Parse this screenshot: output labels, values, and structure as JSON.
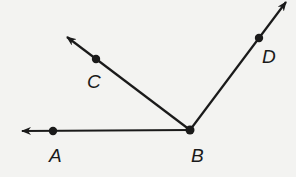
{
  "diagram": {
    "type": "geometry-rays",
    "vertex": {
      "label": "B",
      "x": 190,
      "y": 130
    },
    "rays": [
      {
        "name": "ray-BA",
        "through": "A",
        "point": {
          "x": 53,
          "y": 131
        },
        "tip": {
          "x": 22,
          "y": 131
        }
      },
      {
        "name": "ray-BC",
        "through": "C",
        "point": {
          "x": 96,
          "y": 59
        },
        "tip": {
          "x": 67,
          "y": 37
        }
      },
      {
        "name": "ray-BD",
        "through": "D",
        "point": {
          "x": 259,
          "y": 38
        },
        "tip": {
          "x": 286,
          "y": 2
        }
      }
    ],
    "points": [
      {
        "label": "A",
        "label_x": 49,
        "label_y": 162
      },
      {
        "label": "C",
        "label_x": 87,
        "label_y": 88
      },
      {
        "label": "D",
        "label_x": 262,
        "label_y": 63
      },
      {
        "label": "B",
        "label_x": 191,
        "label_y": 162
      }
    ],
    "colors": {
      "stroke": "#1a1a1a",
      "background": "#f3f3f1"
    }
  }
}
